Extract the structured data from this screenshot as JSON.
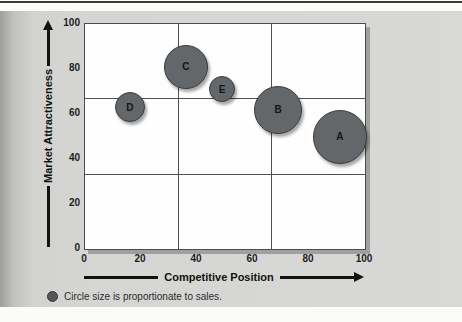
{
  "chart_data": {
    "type": "scatter",
    "subtype": "bubble",
    "title": "",
    "xlabel": "Competitive Position",
    "ylabel": "Market Attractiveness",
    "xlim": [
      0,
      100
    ],
    "ylim": [
      0,
      100
    ],
    "xticks": [
      0,
      20,
      40,
      60,
      80,
      100
    ],
    "yticks": [
      100,
      80,
      60,
      40,
      20,
      0
    ],
    "grid_x": [
      33.33,
      66.67
    ],
    "grid_y": [
      33.33,
      66.67
    ],
    "grid_on": true,
    "legend_position": "below-left",
    "points": [
      {
        "label": "A",
        "x": 91,
        "y": 50,
        "radius_px": 26
      },
      {
        "label": "B",
        "x": 69,
        "y": 62,
        "radius_px": 23
      },
      {
        "label": "C",
        "x": 36,
        "y": 81,
        "radius_px": 21
      },
      {
        "label": "D",
        "x": 16,
        "y": 63,
        "radius_px": 14
      },
      {
        "label": "E",
        "x": 49,
        "y": 71,
        "radius_px": 12
      }
    ],
    "note": "Circle size is proportionate to sales."
  },
  "colors": {
    "bubble_fill": "#64676a",
    "bubble_border": "#3a3c3e",
    "panel_bg": "#d5d5d3",
    "plot_bg": "#fefefe",
    "grid_line": "#4f4f4d",
    "axis_text": "#1d1d1b",
    "top_rule": "#3b3b39"
  }
}
